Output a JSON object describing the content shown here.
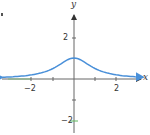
{
  "chart_data": {
    "type": "line",
    "title": "",
    "function": "y = 1/(1+x^2)",
    "xlabel": "x",
    "ylabel": "y",
    "xlim": [
      -3.5,
      3.4
    ],
    "ylim": [
      -2.6,
      3.7
    ],
    "grid": false,
    "legend": null,
    "x_ticks": [
      -2,
      -1,
      1,
      2
    ],
    "x_tick_labels": [
      "−2",
      "2"
    ],
    "y_ticks": [
      -2,
      -1,
      1,
      2
    ],
    "y_tick_labels": [
      "2",
      "−2"
    ],
    "series": [
      {
        "name": "curve",
        "color": "#4a90d9",
        "x": [
          -3.4,
          -3,
          -2.5,
          -2,
          -1.5,
          -1,
          -0.5,
          0,
          0.5,
          1,
          1.5,
          2,
          2.5,
          3,
          3.3
        ],
        "y": [
          0.08,
          0.1,
          0.14,
          0.2,
          0.31,
          0.5,
          0.8,
          1.0,
          0.8,
          0.5,
          0.31,
          0.2,
          0.14,
          0.1,
          0.08
        ]
      }
    ],
    "annotations": []
  },
  "labels": {
    "x_axis": "x",
    "y_axis": "y",
    "x_neg2": "−2",
    "x_pos2": "2",
    "y_pos2": "2",
    "y_neg2": "−2"
  },
  "colors": {
    "axis": "#555555",
    "curve": "#4a90d9",
    "highlight_tick": "#5cb85c"
  }
}
